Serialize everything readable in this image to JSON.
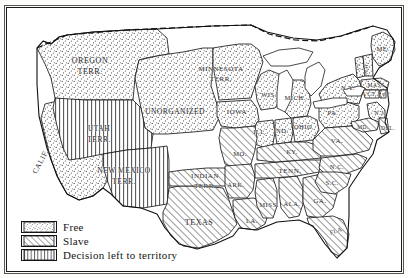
{
  "map": {
    "title": "United States Free and Slave States and Territories",
    "northern_border_style": "dashed",
    "legend": {
      "items": [
        {
          "label": "Free",
          "pattern": "dots",
          "swatch_name": "legend-swatch-free"
        },
        {
          "label": "Slave",
          "pattern": "diagonal-hatch",
          "swatch_name": "legend-swatch-slave"
        },
        {
          "label": "Decision left to territory",
          "pattern": "vertical-lines",
          "swatch_name": "legend-swatch-territory"
        }
      ]
    },
    "colors": {
      "ink": "#1b1b1b",
      "paper": "#ffffff",
      "frame": "#1a1a1a",
      "water": "#ffffff"
    },
    "regions": [
      {
        "name": "OREGON TERR.",
        "label": "OREGON\nTERR.",
        "status": "Free",
        "x": 83,
        "y": 58,
        "size": 8
      },
      {
        "name": "UTAH TERR.",
        "label": "UTAH\nTERR.",
        "status": "Decision left to territory",
        "x": 92,
        "y": 126,
        "size": 7.5
      },
      {
        "name": "CALIF.",
        "label": "CALIF.",
        "status": "Free",
        "x": 34,
        "y": 154,
        "size": 7.5,
        "rotate": -62
      },
      {
        "name": "NEW MEXICO TERR.",
        "label": "NEW MEXICO\nTERR.",
        "status": "Decision left to territory",
        "x": 117,
        "y": 168,
        "size": 7.5
      },
      {
        "name": "UNORGANIZED",
        "label": "UNORGANIZED",
        "status": "Free",
        "x": 168,
        "y": 104,
        "size": 7.5
      },
      {
        "name": "MINNESOTA TERR.",
        "label": "MINNESOTA\nTERR.",
        "status": "Free",
        "x": 214,
        "y": 66,
        "size": 7
      },
      {
        "name": "IOWA",
        "label": "IOWA",
        "status": "Free",
        "x": 230,
        "y": 104,
        "size": 7
      },
      {
        "name": "WIS.",
        "label": "WIS.",
        "status": "Free",
        "x": 262,
        "y": 87,
        "size": 6.5
      },
      {
        "name": "MICH.",
        "label": "MICH.",
        "status": "Free",
        "x": 288,
        "y": 90,
        "size": 6.5
      },
      {
        "name": "ILL.",
        "label": "ILL.",
        "status": "Free",
        "x": 253,
        "y": 124,
        "size": 6.5
      },
      {
        "name": "IND.",
        "label": "IND.",
        "status": "Free",
        "x": 274,
        "y": 123,
        "size": 6.5
      },
      {
        "name": "OHIO",
        "label": "OHIO",
        "status": "Free",
        "x": 296,
        "y": 119,
        "size": 6.5
      },
      {
        "name": "PA.",
        "label": "PA.",
        "status": "Free",
        "x": 326,
        "y": 105,
        "size": 6.5
      },
      {
        "name": "N.Y.",
        "label": "N.Y.",
        "status": "Free",
        "x": 341,
        "y": 80,
        "size": 6.5
      },
      {
        "name": "VT.",
        "label": "VT.",
        "status": "Free",
        "x": 352,
        "y": 58,
        "size": 5,
        "rotate": -90
      },
      {
        "name": "N.H.",
        "label": "N.H.",
        "status": "Free",
        "x": 360,
        "y": 60,
        "size": 5,
        "rotate": -90
      },
      {
        "name": "ME.",
        "label": "ME.",
        "status": "Free",
        "x": 376,
        "y": 41,
        "size": 6.5
      },
      {
        "name": "MASS.",
        "label": "MASS.",
        "status": "Free",
        "x": 370,
        "y": 77,
        "size": 5.5
      },
      {
        "name": "CT.",
        "label": "CT.",
        "status": "Free",
        "x": 365,
        "y": 86,
        "size": 5.5
      },
      {
        "name": "R.I.",
        "label": "R.I.",
        "status": "Free",
        "x": 380,
        "y": 86,
        "size": 5,
        "rotate": -28
      },
      {
        "name": "N.J.",
        "label": "N.J.",
        "status": "Free",
        "x": 373,
        "y": 105,
        "size": 5.5
      },
      {
        "name": "DEL.",
        "label": "DEL.",
        "status": "Slave",
        "x": 381,
        "y": 120,
        "size": 5.5
      },
      {
        "name": "MD.",
        "label": "MD.",
        "status": "Slave",
        "x": 356,
        "y": 119,
        "size": 5.5
      },
      {
        "name": "VA.",
        "label": "VA.",
        "status": "Slave",
        "x": 330,
        "y": 133,
        "size": 7
      },
      {
        "name": "MO.",
        "label": "MO.",
        "status": "Slave",
        "x": 233,
        "y": 146,
        "size": 6.5
      },
      {
        "name": "KY.",
        "label": "KY.",
        "status": "Slave",
        "x": 285,
        "y": 144,
        "size": 6.5
      },
      {
        "name": "TENN.",
        "label": "TENN.",
        "status": "Slave",
        "x": 283,
        "y": 163,
        "size": 7
      },
      {
        "name": "N.C.",
        "label": "N.C.",
        "status": "Slave",
        "x": 330,
        "y": 159,
        "size": 6.5
      },
      {
        "name": "S.C.",
        "label": "S.C.",
        "status": "Slave",
        "x": 325,
        "y": 175,
        "size": 6.5
      },
      {
        "name": "GA.",
        "label": "GA.",
        "status": "Slave",
        "x": 313,
        "y": 193,
        "size": 7
      },
      {
        "name": "ALA.",
        "label": "ALA.",
        "status": "Slave",
        "x": 285,
        "y": 196,
        "size": 6.5
      },
      {
        "name": "MISS.",
        "label": "MISS.",
        "status": "Slave",
        "x": 262,
        "y": 197,
        "size": 6.5
      },
      {
        "name": "ARK.",
        "label": "ARK.",
        "status": "Slave",
        "x": 229,
        "y": 177,
        "size": 6.5
      },
      {
        "name": "LA.",
        "label": "LA.",
        "status": "Slave",
        "x": 245,
        "y": 213,
        "size": 6.5
      },
      {
        "name": "INDIAN TERR.",
        "label": "INDIAN\nTERR.",
        "status": "Slave",
        "x": 198,
        "y": 173,
        "size": 7
      },
      {
        "name": "TEXAS",
        "label": "TEXAS",
        "status": "Slave",
        "x": 192,
        "y": 214,
        "size": 8
      },
      {
        "name": "FLA.",
        "label": "FLA.",
        "status": "Slave",
        "x": 330,
        "y": 223,
        "size": 6,
        "rotate": -18
      }
    ]
  }
}
